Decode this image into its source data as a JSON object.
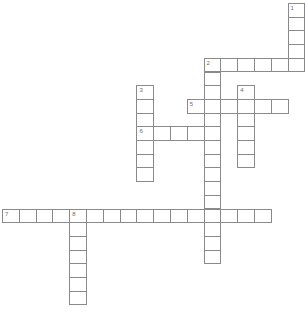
{
  "puzzle": {
    "title": "Crossword",
    "grid_units": "cells",
    "words": [
      {
        "number": "1",
        "direction": "down",
        "row": 0,
        "col": 17,
        "length": 5
      },
      {
        "number": "2",
        "direction": "across",
        "row": 4,
        "col": 12,
        "length": 6
      },
      {
        "number": "2",
        "direction": "down",
        "row": 4,
        "col": 12,
        "length": 15
      },
      {
        "number": "3",
        "direction": "down",
        "row": 6,
        "col": 8,
        "length": 7
      },
      {
        "number": "4",
        "direction": "down",
        "row": 6,
        "col": 14,
        "length": 6
      },
      {
        "number": "5",
        "direction": "across",
        "row": 7,
        "col": 11,
        "length": 6
      },
      {
        "number": "6",
        "direction": "across",
        "row": 9,
        "col": 8,
        "length": 5
      },
      {
        "number": "7",
        "direction": "across",
        "row": 15,
        "col": 0,
        "length": 16
      },
      {
        "number": "8",
        "direction": "down",
        "row": 15,
        "col": 4,
        "length": 7
      }
    ],
    "entries": {},
    "colors": {
      "cell_border": "#8a8a8a",
      "cell_fill": "#ffffff",
      "number_text": "#6e6e6e"
    }
  }
}
